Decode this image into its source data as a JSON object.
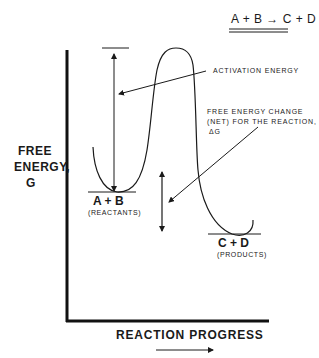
{
  "diagram": {
    "equation": "A + B → C + D",
    "y_axis_label": {
      "line1": "FREE",
      "line2": "ENERGY,",
      "line3": "G"
    },
    "x_axis_label": "REACTION PROGRESS",
    "annotations": {
      "activation_energy": "ACTIVATION ENERGY",
      "free_energy_change": {
        "line1": "FREE ENERGY CHANGE",
        "line2": "(NET) FOR THE REACTION,",
        "line3": "ΔG"
      }
    },
    "states": {
      "reactants": {
        "formula": "A + B",
        "label": "(REACTANTS)"
      },
      "products": {
        "formula": "C + D",
        "label": "(PRODUCTS)"
      }
    },
    "colors": {
      "ink": "#1a1a1a",
      "background": "#ffffff"
    }
  }
}
